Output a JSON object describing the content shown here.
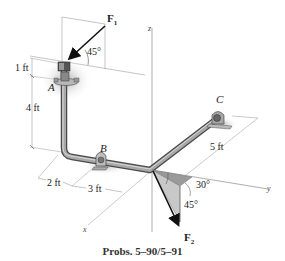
{
  "figure": {
    "caption": "Probs. 5–90/5–91",
    "points": {
      "A": "A",
      "B": "B",
      "C": "C"
    },
    "axes": {
      "x": "x",
      "y": "y",
      "z": "z"
    },
    "forces": {
      "F1": {
        "symbol": "F",
        "subscript": "1",
        "angle": "45°"
      },
      "F2": {
        "symbol": "F",
        "subscript": "2",
        "angle_horizontal": "30°",
        "angle_vertical": "45°"
      }
    },
    "dimensions": {
      "top_offset": "1 ft",
      "vertical_pipe": "4 ft",
      "x_offset_a": "2 ft",
      "x_offset_b": "3 ft",
      "bc_length": "5 ft"
    },
    "colors": {
      "pipe": "#8a8a8a",
      "pipe_dark": "#5a5a5a",
      "shadow": "#c8c8c8",
      "force_arrow": "#111111",
      "angle_fill": "#bdbdbd"
    }
  }
}
